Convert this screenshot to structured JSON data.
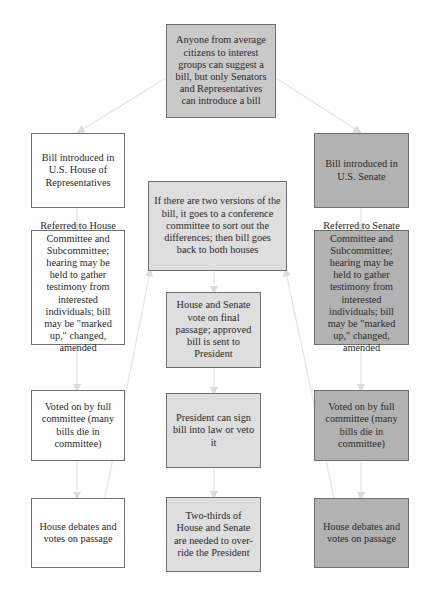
{
  "diagram": {
    "title_node": "Anyone from average citizens to interest groups can suggest a bill, but only Senators and Representatives can introduce a bill",
    "house": {
      "steps": [
        "Bill introduced in U.S. House of Representatives",
        "Referred to House Committee and Subcommittee; hearing may be held to gather testimony from interested individuals; bill may be \"marked up,\" changed, amended",
        "Voted on by full committee (many bills die in committee)",
        "House debates and votes on passage"
      ]
    },
    "senate": {
      "steps": [
        "Bill introduced in U.S. Senate",
        "Referred to Senate Committee and Subcommittee; hearing may be held to gather testimony from interested individuals; bill may be \"marked up,\" changed, amended",
        "Voted on by full committee (many bills die in committee)",
        "House debates and votes on passage"
      ]
    },
    "center": {
      "steps": [
        "If there are two versions of the bill, it goes to a conference committee to sort out the differences; then bill goes back to both houses",
        "House and Senate vote on final passage; approved bill is sent to President",
        "President can sign bill into law or veto it",
        "Two-thirds of House and Senate are needed to over-ride the President"
      ]
    },
    "colors": {
      "top_fill": "#c9c9c9",
      "house_fill": "#ffffff",
      "center_fill": "#dedede",
      "senate_fill": "#b2b2b2",
      "border": "#6f6f6f",
      "arrow": "#e2e2e2"
    }
  }
}
